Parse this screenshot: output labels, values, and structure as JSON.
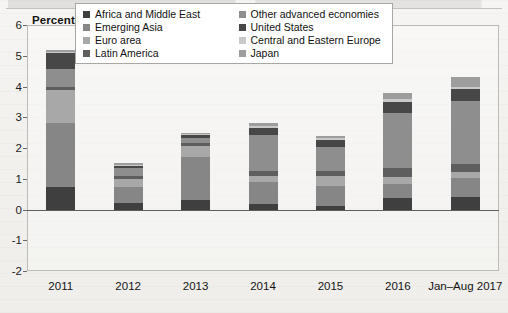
{
  "axis": {
    "y_title": "Percentage points",
    "y_ticks": [
      "6",
      "5",
      "4",
      "3",
      "2",
      "1",
      "0",
      "-1",
      "-2"
    ]
  },
  "legend": {
    "items": [
      {
        "label": "Africa and Middle East",
        "color": "#3f3f3f"
      },
      {
        "label": "Emerging Asia",
        "color": "#868686"
      },
      {
        "label": "Euro area",
        "color": "#a8a8a8"
      },
      {
        "label": "Latin America",
        "color": "#5e5e5e"
      },
      {
        "label": "Other advanced economies",
        "color": "#8e8e8e"
      },
      {
        "label": "United States",
        "color": "#474747"
      },
      {
        "label": "Central and Eastern Europe",
        "color": "#c9c9c9"
      },
      {
        "label": "Japan",
        "color": "#9d9d9d"
      }
    ]
  },
  "chart_data": {
    "type": "bar",
    "subtype": "stacked",
    "title": "Percentage points",
    "xlabel": "",
    "ylabel": "Percentage points",
    "ylim": [
      -2,
      6
    ],
    "yticks": [
      -2,
      -1,
      0,
      1,
      2,
      3,
      4,
      5,
      6
    ],
    "grid": false,
    "legend_position": "top-center-inside",
    "categories": [
      "2011",
      "2012",
      "2013",
      "2014",
      "2015",
      "2016",
      "Jan–Aug 2017"
    ],
    "series": [
      {
        "name": "Africa and Middle East",
        "color": "#3f3f3f",
        "values": [
          0.72,
          0.22,
          0.3,
          0.17,
          0.12,
          0.36,
          0.42
        ]
      },
      {
        "name": "Emerging Asia",
        "color": "#868686",
        "values": [
          2.08,
          0.52,
          1.4,
          0.72,
          0.64,
          0.46,
          0.6
        ]
      },
      {
        "name": "Euro area",
        "color": "#a8a8a8",
        "values": [
          1.08,
          0.26,
          0.38,
          0.2,
          0.34,
          0.24,
          0.2
        ]
      },
      {
        "name": "Latin America",
        "color": "#5e5e5e",
        "values": [
          0.1,
          0.1,
          0.1,
          0.16,
          0.14,
          0.28,
          0.26
        ]
      },
      {
        "name": "Other advanced economies",
        "color": "#8e8e8e",
        "values": [
          0.58,
          0.24,
          0.16,
          1.16,
          0.8,
          1.8,
          2.06
        ]
      },
      {
        "name": "United States",
        "color": "#474747",
        "values": [
          0.52,
          0.08,
          0.08,
          0.24,
          0.22,
          0.36,
          0.38
        ]
      },
      {
        "name": "Central and Eastern Europe",
        "color": "#c9c9c9",
        "values": [
          0.06,
          0.04,
          0.04,
          0.06,
          0.06,
          0.1,
          0.08
        ]
      },
      {
        "name": "Japan",
        "color": "#9d9d9d",
        "values": [
          0.06,
          0.04,
          0.04,
          0.09,
          0.08,
          0.2,
          0.32
        ]
      }
    ],
    "totals": [
      5.2,
      1.5,
      2.5,
      2.8,
      2.4,
      3.8,
      4.32
    ]
  }
}
